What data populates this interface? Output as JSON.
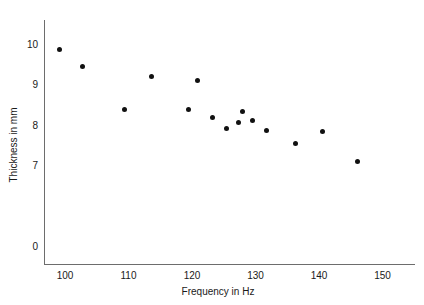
{
  "chart_data": {
    "type": "scatter",
    "title": "",
    "xlabel": "Frequency in Hz",
    "ylabel": "Thickness in mm",
    "xlim": [
      97,
      152
    ],
    "ylim": [
      6.2,
      10.4
    ],
    "grid": false,
    "legend": "none",
    "xticks": [
      "100",
      "110",
      "120",
      "130",
      "140",
      "150"
    ],
    "xtick_values": [
      100,
      110,
      120,
      130,
      140,
      150
    ],
    "yticks": [
      "0",
      "7",
      "8",
      "9",
      "10"
    ],
    "ytick_values": [
      0,
      7,
      8,
      9,
      10
    ],
    "y_axis_break": true,
    "marker": "filled-circle",
    "marker_color": "#111111",
    "axis_color": "#6d6d6d",
    "points": [
      {
        "x": 99.2,
        "y": 9.88
      },
      {
        "x": 102.8,
        "y": 9.45
      },
      {
        "x": 109.4,
        "y": 8.4
      },
      {
        "x": 113.6,
        "y": 9.22
      },
      {
        "x": 119.5,
        "y": 8.39
      },
      {
        "x": 120.8,
        "y": 9.1
      },
      {
        "x": 123.3,
        "y": 8.2
      },
      {
        "x": 125.5,
        "y": 7.92
      },
      {
        "x": 127.3,
        "y": 8.07
      },
      {
        "x": 128.0,
        "y": 8.35
      },
      {
        "x": 129.6,
        "y": 8.12
      },
      {
        "x": 131.7,
        "y": 7.87
      },
      {
        "x": 136.3,
        "y": 7.55
      },
      {
        "x": 140.6,
        "y": 7.86
      },
      {
        "x": 146.0,
        "y": 7.12
      }
    ]
  },
  "axes": {
    "x_title": "Frequency in Hz",
    "y_title": "Thickness in mm",
    "x_ticks": [
      {
        "label": "100",
        "value": 100
      },
      {
        "label": "110",
        "value": 110
      },
      {
        "label": "120",
        "value": 120
      },
      {
        "label": "130",
        "value": 130
      },
      {
        "label": "140",
        "value": 140
      },
      {
        "label": "150",
        "value": 150
      }
    ],
    "y_ticks": [
      {
        "label": "10",
        "value": 10
      },
      {
        "label": "9",
        "value": 9
      },
      {
        "label": "8",
        "value": 8
      },
      {
        "label": "7",
        "value": 7
      },
      {
        "label": "0",
        "value": 0
      }
    ]
  }
}
